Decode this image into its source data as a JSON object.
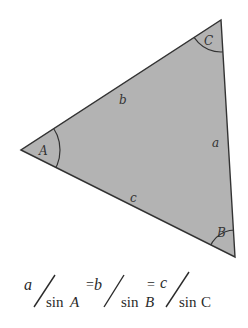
{
  "diagram": {
    "colors": {
      "fill": "#b3b3b3",
      "stroke": "#333333",
      "background": "#ffffff"
    },
    "vertices": [
      {
        "name": "A",
        "label": "A",
        "x": 21,
        "y": 150
      },
      {
        "name": "B",
        "label": "B",
        "x": 235,
        "y": 257
      },
      {
        "name": "C",
        "label": "C",
        "x": 221,
        "y": 20
      }
    ],
    "sides": [
      {
        "name": "a",
        "label": "a",
        "between": [
          "B",
          "C"
        ]
      },
      {
        "name": "b",
        "label": "b",
        "between": [
          "A",
          "C"
        ]
      },
      {
        "name": "c",
        "label": "c",
        "between": [
          "A",
          "B"
        ]
      }
    ],
    "formula": {
      "text": "a/sin A = b/sin B = c/sinC",
      "terms": [
        {
          "numerator": "a",
          "denominator_fn": "sin",
          "denominator_var": "A"
        },
        {
          "numerator": "b",
          "denominator_fn": "sin",
          "denominator_var": "B"
        },
        {
          "numerator": "c",
          "denominator_fn": "sin",
          "denominator_var": "C"
        }
      ],
      "equals": "="
    }
  }
}
